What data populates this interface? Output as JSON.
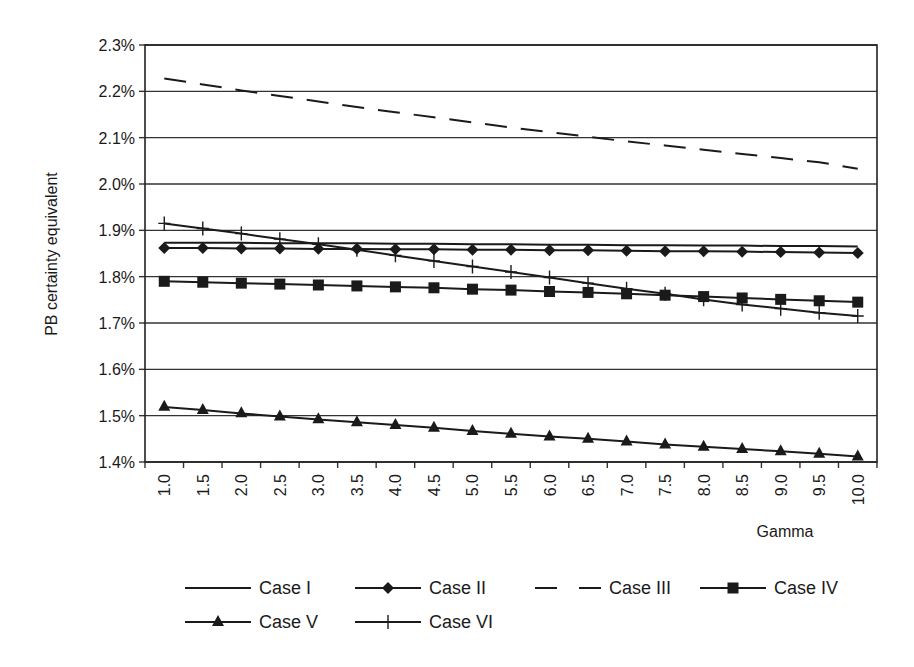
{
  "chart_data": {
    "type": "line",
    "title": "",
    "xlabel": "Gamma",
    "ylabel": "PB certainty equivalent",
    "ylim": [
      1.4,
      2.3
    ],
    "y_ticks": [
      "1.4%",
      "1.5%",
      "1.6%",
      "1.7%",
      "1.8%",
      "1.9%",
      "2.0%",
      "2.1%",
      "2.2%",
      "2.3%"
    ],
    "grid": "horizontal",
    "legend_position": "bottom",
    "categories": [
      "1.0",
      "1.5",
      "2.0",
      "2.5",
      "3.0",
      "3.5",
      "4.0",
      "4.5",
      "5.0",
      "5.5",
      "6.0",
      "6.5",
      "7.0",
      "7.5",
      "8.0",
      "8.5",
      "9.0",
      "9.5",
      "10.0"
    ],
    "series": [
      {
        "name": "Case I",
        "marker": "none",
        "dash": "solid",
        "values": [
          1.873,
          1.873,
          1.873,
          1.872,
          1.872,
          1.872,
          1.871,
          1.871,
          1.87,
          1.87,
          1.869,
          1.869,
          1.868,
          1.868,
          1.867,
          1.867,
          1.866,
          1.866,
          1.865
        ]
      },
      {
        "name": "Case II",
        "marker": "diamond",
        "dash": "solid",
        "values": [
          1.862,
          1.862,
          1.861,
          1.861,
          1.86,
          1.86,
          1.859,
          1.859,
          1.858,
          1.858,
          1.857,
          1.857,
          1.856,
          1.855,
          1.855,
          1.854,
          1.853,
          1.852,
          1.851
        ]
      },
      {
        "name": "Case III",
        "marker": "none",
        "dash": "dashed",
        "values": [
          2.228,
          2.215,
          2.202,
          2.19,
          2.178,
          2.166,
          2.155,
          2.144,
          2.133,
          2.122,
          2.112,
          2.102,
          2.092,
          2.083,
          2.074,
          2.065,
          2.056,
          2.047,
          2.033
        ]
      },
      {
        "name": "Case IV",
        "marker": "square",
        "dash": "solid",
        "values": [
          1.79,
          1.788,
          1.786,
          1.784,
          1.782,
          1.78,
          1.778,
          1.776,
          1.773,
          1.771,
          1.768,
          1.766,
          1.763,
          1.76,
          1.757,
          1.754,
          1.751,
          1.748,
          1.745
        ]
      },
      {
        "name": "Case V",
        "marker": "triangle",
        "dash": "solid",
        "values": [
          1.519,
          1.512,
          1.505,
          1.498,
          1.492,
          1.486,
          1.48,
          1.474,
          1.467,
          1.461,
          1.455,
          1.45,
          1.444,
          1.438,
          1.433,
          1.428,
          1.423,
          1.418,
          1.412
        ]
      },
      {
        "name": "Case VI",
        "marker": "plus",
        "dash": "solid",
        "values": [
          1.915,
          1.904,
          1.893,
          1.881,
          1.87,
          1.858,
          1.846,
          1.834,
          1.822,
          1.81,
          1.798,
          1.786,
          1.774,
          1.763,
          1.751,
          1.74,
          1.731,
          1.722,
          1.715
        ]
      }
    ]
  },
  "axis": {
    "x_title": "Gamma",
    "y_title": "PB certainty equivalent"
  },
  "legend": {
    "items": [
      "Case I",
      "Case II",
      "Case III",
      "Case IV",
      "Case V",
      "Case VI"
    ]
  },
  "colors": {
    "line": "#1a1a1a",
    "grid": "#333333",
    "background": "#ffffff"
  }
}
